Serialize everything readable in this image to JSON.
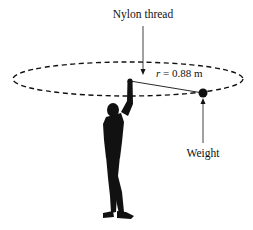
{
  "labels": {
    "thread": "Nylon thread",
    "radius_symbol": "r",
    "radius_value": " = 0.88 m",
    "weight": "Weight"
  },
  "colors": {
    "ink": "#111111",
    "background": "#ffffff"
  }
}
